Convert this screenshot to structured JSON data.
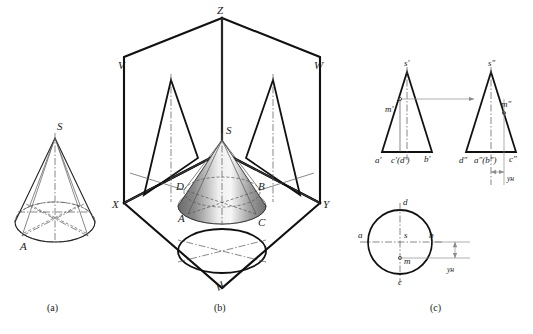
{
  "figure": {
    "captions": [
      {
        "id": "cap-a",
        "text": "(a)"
      },
      {
        "id": "cap-b",
        "text": "(b)"
      },
      {
        "id": "cap-c",
        "text": "(c)"
      }
    ]
  },
  "panel_a": {
    "name": "pictorial-cone-with-inscribed-lines",
    "labels": [
      {
        "id": "a-apex",
        "text": "S"
      },
      {
        "id": "a-base-point",
        "text": "A"
      }
    ]
  },
  "panel_b": {
    "name": "three-projection-planes-with-cone",
    "axis_labels": [
      {
        "id": "b-z",
        "text": "Z"
      },
      {
        "id": "b-x",
        "text": "X"
      },
      {
        "id": "b-y",
        "text": "Y"
      }
    ],
    "plane_labels": [
      {
        "id": "b-v",
        "text": "V"
      },
      {
        "id": "b-w",
        "text": "W"
      },
      {
        "id": "b-h",
        "text": "H"
      }
    ],
    "cone_labels": [
      {
        "id": "b-s",
        "text": "S"
      },
      {
        "id": "b-a",
        "text": "A"
      },
      {
        "id": "b-b",
        "text": "B"
      },
      {
        "id": "b-c",
        "text": "C"
      },
      {
        "id": "b-d",
        "text": "D"
      }
    ]
  },
  "panel_c": {
    "name": "orthographic-three-views",
    "front_view": {
      "name": "front-view-v-projection",
      "labels": [
        {
          "id": "c-s-prime",
          "text": "s′"
        },
        {
          "id": "c-m-prime",
          "text": "m′"
        },
        {
          "id": "c-a-prime",
          "text": "a′"
        },
        {
          "id": "c-cd-prime",
          "text": "c′(d′)"
        },
        {
          "id": "c-b-prime",
          "text": "b′"
        }
      ]
    },
    "side_view": {
      "name": "side-view-w-projection",
      "labels": [
        {
          "id": "c-s-dprime",
          "text": "s″"
        },
        {
          "id": "c-m-dprime",
          "text": "m″"
        },
        {
          "id": "c-d-dprime",
          "text": "d″"
        },
        {
          "id": "c-ab-dprime",
          "text": "a″(b″)"
        },
        {
          "id": "c-c-dprime",
          "text": "c″"
        }
      ],
      "axis_label": {
        "id": "c-yh-right",
        "text": "yʜ"
      }
    },
    "top_view": {
      "name": "top-view-h-projection",
      "labels": [
        {
          "id": "c-d",
          "text": "d"
        },
        {
          "id": "c-a",
          "text": "a"
        },
        {
          "id": "c-s",
          "text": "s"
        },
        {
          "id": "c-b",
          "text": "b"
        },
        {
          "id": "c-m",
          "text": "m"
        },
        {
          "id": "c-c",
          "text": "c"
        }
      ],
      "axis_label": {
        "id": "c-yh-bottom",
        "text": "yʜ"
      }
    }
  },
  "colors": {
    "line_dark": "#111111",
    "line_medium": "#222222",
    "line_thin": "#555555",
    "projection_gray": "#8c8c8c",
    "background": "#ffffff",
    "cone_shade_dark": "#5a5a5a",
    "cone_shade_light": "#f2f2f2"
  }
}
